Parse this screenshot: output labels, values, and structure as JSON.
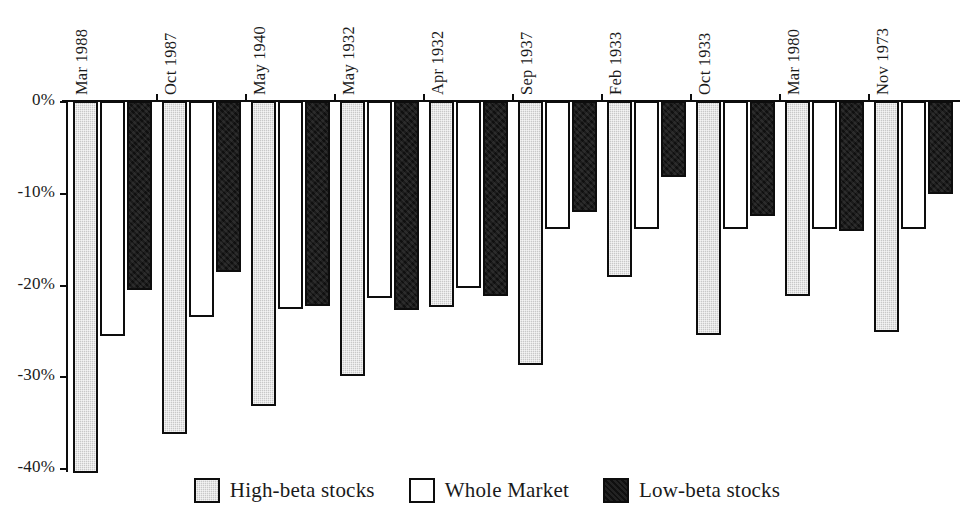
{
  "chart_data": {
    "type": "bar",
    "title": "",
    "subtitle": "",
    "xlabel": "",
    "ylabel": "",
    "ylim": [
      -40,
      0
    ],
    "grid": false,
    "legend_position": "bottom",
    "y_ticks": [
      "0%",
      "-10%",
      "-20%",
      "-30%",
      "-40%"
    ],
    "y_tick_values": [
      0,
      -10,
      -20,
      -30,
      -40
    ],
    "categories": [
      "Mar 1988",
      "Oct 1987",
      "May 1940",
      "May 1932",
      "Apr 1932",
      "Sep 1937",
      "Feb 1933",
      "Oct 1933",
      "Mar 1980",
      "Nov 1973"
    ],
    "series": [
      {
        "name": "High-beta stocks",
        "color": "#c8c8c8",
        "values": [
          -40.5,
          -36.3,
          -33.2,
          -30.0,
          -22.4,
          -28.8,
          -19.2,
          -25.5,
          -21.2,
          -25.2
        ]
      },
      {
        "name": "Whole Market",
        "color": "#ffffff",
        "values": [
          -25.6,
          -23.5,
          -22.7,
          -21.5,
          -20.4,
          -13.9,
          -13.9,
          -13.9,
          -13.9,
          -13.9
        ]
      },
      {
        "name": "Low-beta stocks",
        "color": "#101010",
        "values": [
          -20.6,
          -18.6,
          -22.3,
          -22.8,
          -21.2,
          -12.1,
          -8.3,
          -12.5,
          -14.2,
          -10.1
        ]
      }
    ]
  },
  "legend": {
    "items": [
      {
        "label": "High-beta stocks",
        "swatch": "gray-hatched-swatch"
      },
      {
        "label": "Whole Market",
        "swatch": "white-swatch"
      },
      {
        "label": "Low-beta stocks",
        "swatch": "black-swatch"
      }
    ]
  }
}
